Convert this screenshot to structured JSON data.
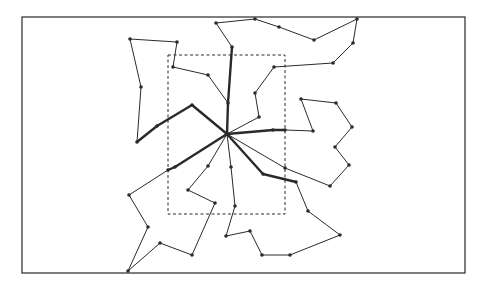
{
  "diagram": {
    "colors": {
      "background": "#ffffff",
      "line": "#2a2a2a",
      "frame": "#3a3a3a"
    },
    "frame": {
      "x": 22,
      "y": 17,
      "w": 443,
      "h": 256
    },
    "inner_region": {
      "x": 168,
      "y": 55,
      "w": 117,
      "h": 159,
      "style": "dashed"
    },
    "hub": {
      "x": 227,
      "y": 134
    },
    "thick_edges": [
      [
        [
          227,
          134
        ],
        [
          228,
          103
        ],
        [
          232,
          47
        ]
      ],
      [
        [
          227,
          134
        ],
        [
          192,
          105
        ],
        [
          157,
          126
        ],
        [
          137,
          142
        ]
      ],
      [
        [
          227,
          134
        ],
        [
          273,
          130
        ],
        [
          285,
          130
        ]
      ],
      [
        [
          227,
          134
        ],
        [
          263,
          174
        ],
        [
          296,
          182
        ]
      ],
      [
        [
          227,
          134
        ],
        [
          175,
          167
        ],
        [
          168,
          170
        ]
      ]
    ],
    "routes": [
      [
        [
          232,
          47
        ],
        [
          216,
          23
        ],
        [
          255,
          19
        ],
        [
          279,
          27
        ],
        [
          314,
          40
        ],
        [
          357,
          19
        ],
        [
          353,
          43
        ],
        [
          333,
          63
        ],
        [
          274,
          67
        ],
        [
          255,
          93
        ],
        [
          259,
          117
        ],
        [
          227,
          134
        ]
      ],
      [
        [
          137,
          142
        ],
        [
          141,
          87
        ],
        [
          130,
          39
        ],
        [
          177,
          42
        ],
        [
          173,
          67
        ],
        [
          208,
          75
        ],
        [
          228,
          103
        ]
      ],
      [
        [
          285,
          130
        ],
        [
          313,
          131
        ],
        [
          301,
          99
        ],
        [
          336,
          103
        ],
        [
          352,
          127
        ],
        [
          335,
          147
        ],
        [
          349,
          165
        ],
        [
          330,
          186
        ],
        [
          285,
          168
        ],
        [
          227,
          134
        ]
      ],
      [
        [
          296,
          182
        ],
        [
          308,
          211
        ],
        [
          340,
          235
        ],
        [
          290,
          255
        ],
        [
          262,
          255
        ],
        [
          250,
          231
        ],
        [
          226,
          236
        ],
        [
          235,
          206
        ],
        [
          231,
          167
        ],
        [
          227,
          134
        ]
      ],
      [
        [
          168,
          170
        ],
        [
          129,
          195
        ],
        [
          148,
          227
        ],
        [
          128,
          271
        ],
        [
          160,
          243
        ],
        [
          192,
          255
        ],
        [
          215,
          203
        ],
        [
          188,
          190
        ],
        [
          208,
          166
        ],
        [
          227,
          134
        ]
      ]
    ]
  }
}
